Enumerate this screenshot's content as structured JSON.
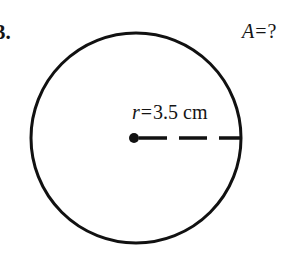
{
  "page": {
    "width": 303,
    "height": 259,
    "background_color": "#ffffff",
    "ink_color": "#141414"
  },
  "problem": {
    "number_label": "3.",
    "question_label": "A = ?",
    "question_variable": "A",
    "question_relation": "=",
    "question_value": "?"
  },
  "figure": {
    "shape_name": "circle",
    "stroke_color": "#111111",
    "stroke_width": 3,
    "fill": "none",
    "center_x": 136,
    "center_y": 138,
    "radius_px": 105,
    "center_dot": {
      "label": "center-point",
      "x": 134,
      "y": 138,
      "diameter": 10,
      "color": "#111111"
    },
    "radius_line": {
      "label": "radius-segment",
      "x1": 136,
      "y1": 138,
      "x2": 240,
      "y2": 138,
      "style": "dashed",
      "dash_on": 28,
      "dash_off": 12,
      "stroke_width": 3,
      "color": "#111111"
    }
  },
  "radius_annotation": {
    "full_text": "r = 3.5 cm",
    "variable": "r",
    "relation": "=",
    "value": "3.5",
    "unit": "cm"
  }
}
